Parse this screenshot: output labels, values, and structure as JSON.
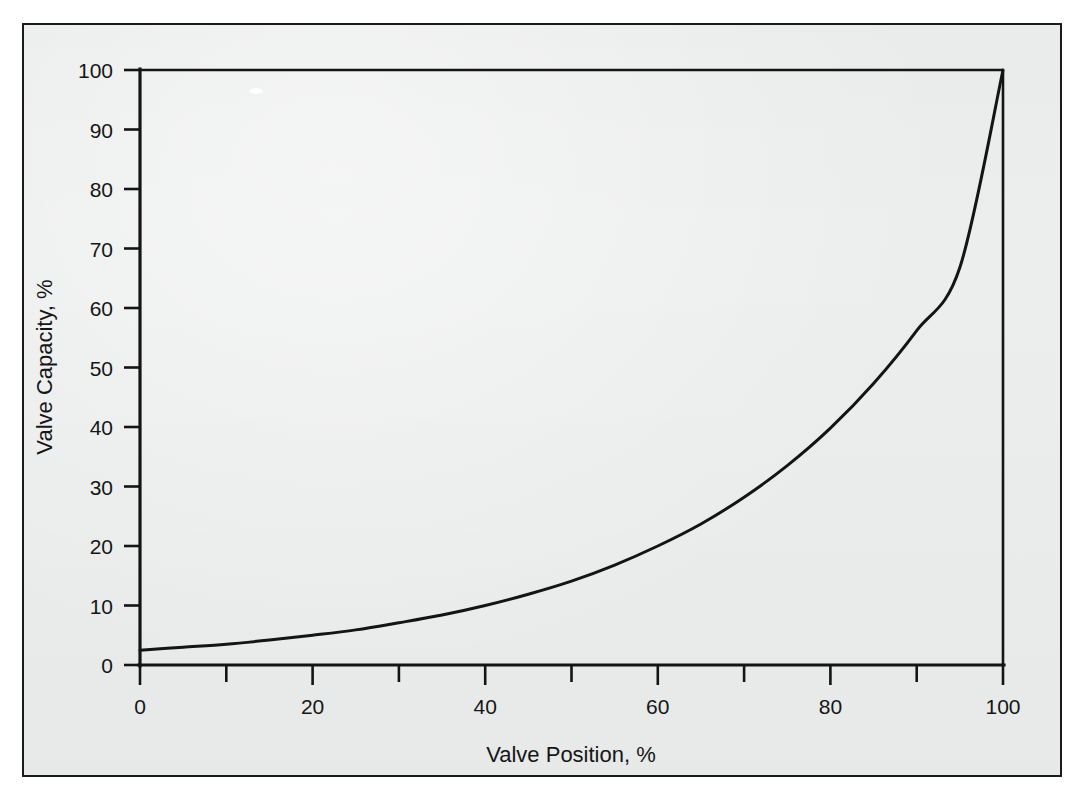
{
  "figure": {
    "background_color": "#eceeed",
    "ink_color": "#141414",
    "border_color": "#1a1a1a"
  },
  "chart_data": {
    "type": "line",
    "title": "",
    "subtitle": "",
    "xlabel": "Valve Position, %",
    "ylabel": "Valve Capacity, %",
    "xlim": [
      0,
      100
    ],
    "ylim": [
      0,
      100
    ],
    "grid": false,
    "legend": null,
    "legend_position": "none",
    "x_major_ticks": [
      0,
      20,
      40,
      60,
      80,
      100
    ],
    "x_minor_ticks": [
      10,
      30,
      50,
      70,
      90
    ],
    "x_tick_labels": [
      "0",
      "20",
      "40",
      "60",
      "80",
      "100"
    ],
    "y_major_ticks": [
      0,
      10,
      20,
      30,
      40,
      50,
      60,
      70,
      80,
      90,
      100
    ],
    "y_tick_labels": [
      "0",
      "10",
      "20",
      "30",
      "40",
      "50",
      "60",
      "70",
      "80",
      "90",
      "100"
    ],
    "annotations": [],
    "series": [
      {
        "name": "Equal percentage characteristic",
        "x": [
          0,
          5,
          10,
          15,
          20,
          25,
          30,
          35,
          40,
          45,
          50,
          55,
          60,
          65,
          70,
          75,
          80,
          85,
          90,
          95,
          100
        ],
        "values": [
          2.5,
          3.0,
          3.5,
          4.2,
          5.0,
          5.9,
          7.1,
          8.4,
          10.0,
          11.9,
          14.1,
          16.8,
          20.0,
          23.7,
          28.2,
          33.5,
          39.8,
          47.3,
          56.2,
          66.8,
          100.0
        ]
      }
    ]
  }
}
